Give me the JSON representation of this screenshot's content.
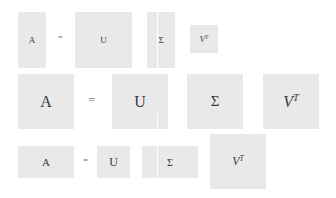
{
  "diagram": {
    "title": "",
    "rows": [
      {
        "name": "row-1",
        "lhs": "A",
        "equals": "=",
        "factors": [
          "U",
          "Σ",
          "V",
          "T"
        ],
        "box_color": "#e9e9e9"
      },
      {
        "name": "row-2",
        "lhs": "A",
        "equals": "=",
        "factors": [
          "U",
          "Σ",
          "V",
          "T"
        ],
        "box_color": "#e9e9e9"
      },
      {
        "name": "row-3",
        "lhs": "A",
        "equals": "=",
        "factors": [
          "U",
          "Σ",
          "V",
          "T"
        ],
        "box_color": "#e9e9e9"
      }
    ]
  }
}
